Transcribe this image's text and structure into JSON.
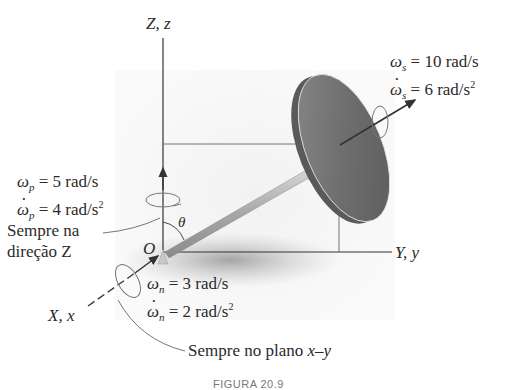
{
  "figure": {
    "caption": "FIGURA 20.9",
    "axes": {
      "z_label": "Z, z",
      "y_label": "Y, y",
      "x_label": "X, x",
      "origin_label": "O",
      "angle_label": "θ"
    },
    "spin": {
      "omega": "ω",
      "sub": "s",
      "omega_value": " = 10 rad/s",
      "omega_dot_value": " = 6 rad/s",
      "omega_dot_exp": "2"
    },
    "precession": {
      "omega": "ω",
      "sub": "p",
      "omega_value": " = 5 rad/s",
      "omega_dot_value": " = 4 rad/s",
      "omega_dot_exp": "2"
    },
    "nutation": {
      "omega": "ω",
      "sub": "n",
      "omega_value": " = 3 rad/s",
      "omega_dot_value": " = 2 rad/s",
      "omega_dot_exp": "2"
    },
    "notes": {
      "z_direction_line1": "Sempre na",
      "z_direction_line2": "direção Z",
      "xy_plane_prefix": "Sempre no plano ",
      "xy_plane_var": "x–y"
    },
    "colors": {
      "disk": "#6a6a6a",
      "rod": "#b0b0b0",
      "axis": "#333333",
      "shadow": "#888888"
    }
  }
}
